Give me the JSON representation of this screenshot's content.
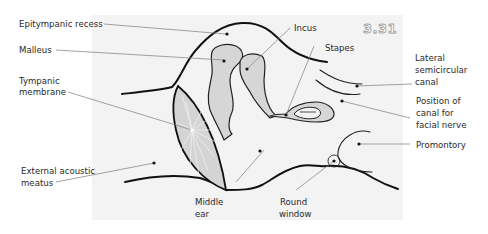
{
  "figure": {
    "number": "3.31",
    "panel_color": "#f3f3f3",
    "bone_fill": "#d6d6d6"
  },
  "labels": {
    "epitympanic_recess": "Epitympanic recess",
    "malleus": "Malleus",
    "tympanic_membrane_1": "Tympanic",
    "tympanic_membrane_2": "membrane",
    "external_acoustic_meatus_1": "External acoustic",
    "external_acoustic_meatus_2": "meatus",
    "middle_ear_1": "Middle",
    "middle_ear_2": "ear",
    "incus": "Incus",
    "stapes": "Stapes",
    "lateral_semicircular_canal_1": "Lateral",
    "lateral_semicircular_canal_2": "semicircular",
    "lateral_semicircular_canal_3": "canal",
    "facial_nerve_canal_1": "Position of",
    "facial_nerve_canal_2": "canal for",
    "facial_nerve_canal_3": "facial nerve",
    "promontory": "Promontory",
    "round_window_1": "Round",
    "round_window_2": "window"
  }
}
